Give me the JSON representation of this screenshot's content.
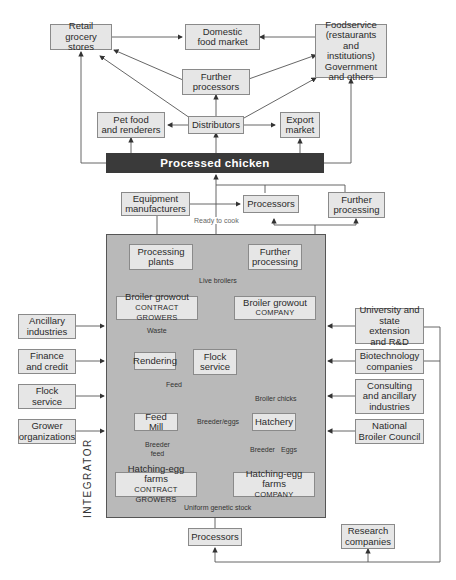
{
  "diagram": {
    "top_market": {
      "retail": "Retail grocery stores",
      "retail_l1": "Retail",
      "retail_l2": "grocery stores",
      "domestic_l1": "Domestic",
      "domestic_l2": "food market",
      "foodservice_l1": "Foodservice",
      "foodservice_l2": "(restaurants",
      "foodservice_l3": "and institutions)",
      "foodservice_l4": "Government",
      "foodservice_l5": "and others",
      "further_processors_l1": "Further",
      "further_processors_l2": "processors",
      "petfood_l1": "Pet food",
      "petfood_l2": "and renderers",
      "distributors": "Distributors",
      "export_l1": "Export",
      "export_l2": "market"
    },
    "banner": "Processed chicken",
    "mid": {
      "equipment_l1": "Equipment",
      "equipment_l2": "manufacturers",
      "processors": "Processors",
      "further_processing_l1": "Further",
      "further_processing_l2": "processing",
      "ready_to_cook": "Ready to cook"
    },
    "integrator": {
      "label": "INTEGRATOR",
      "processing_plants_l1": "Processing",
      "processing_plants_l2": "plants",
      "further_processing_l1": "Further",
      "further_processing_l2": "processing",
      "live_broilers": "Live broilers",
      "growout_contract_l1": "Broiler growout",
      "growout_contract_l2": "CONTRACT GROWERS",
      "growout_company_l1": "Broiler growout",
      "growout_company_l2": "COMPANY",
      "waste": "Waste",
      "rendering": "Rendering",
      "flock_service_l1": "Flock",
      "flock_service_l2": "service",
      "feed": "Feed",
      "broiler_chicks": "Broiler chicks",
      "feed_mill": "Feed Mill",
      "breeder_eggs": "Breeder/eggs",
      "hatchery": "Hatchery",
      "breeder_feed_l1": "Breeder",
      "breeder_feed_l2": "feed",
      "breeder": "Breeder",
      "eggs": "Eggs",
      "hef_contract_l1": "Hatching-egg farms",
      "hef_contract_l2": "CONTRACT GROWERS",
      "hef_company_l1": "Hatching-egg farms",
      "hef_company_l2": "COMPANY",
      "uniform_genetic_stock": "Uniform genetic stock"
    },
    "left_inputs": [
      {
        "l1": "Ancillary",
        "l2": "industries"
      },
      {
        "l1": "Finance",
        "l2": "and credit"
      },
      {
        "l1": "Flock",
        "l2": "service"
      },
      {
        "l1": "Grower",
        "l2": "organizations"
      }
    ],
    "right_inputs": [
      {
        "l1": "University and",
        "l2": "state extension",
        "l3": "and R&D"
      },
      {
        "l1": "Biotechnology",
        "l2": "companies"
      },
      {
        "l1": "Consulting",
        "l2": "and ancillary",
        "l3": "industries"
      },
      {
        "l1": "National",
        "l2": "Broiler Council"
      }
    ],
    "bottom": {
      "processors": "Processors",
      "research_l1": "Research",
      "research_l2": "companies"
    },
    "colors": {
      "box_fill": "#e6e6e6",
      "integrator_fill": "#b9b9b9",
      "banner_fill": "#3a3a3a",
      "line": "#555555"
    }
  }
}
